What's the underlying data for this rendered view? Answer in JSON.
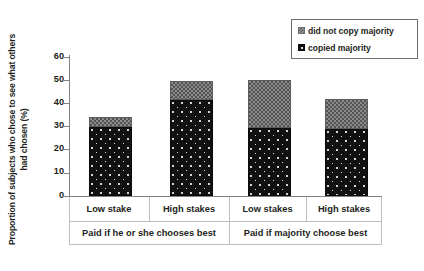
{
  "chart_data": {
    "type": "bar",
    "subtype": "stacked",
    "title": "",
    "xlabel": "",
    "ylabel": "Proportion of subjects who  chose to see what others\nhad chosen (%)",
    "ylim": [
      0,
      60
    ],
    "yticks": [
      0,
      10,
      20,
      30,
      40,
      50,
      60
    ],
    "ytick_labels": [
      "0",
      "10",
      "20",
      "30",
      "40",
      "50",
      "60"
    ],
    "grid": false,
    "legend_position": "top-right",
    "categories": [
      "Low stake",
      "High stakes",
      "Low stakes",
      "High stakes"
    ],
    "groups": [
      {
        "label": "Paid if he or she chooses best",
        "categories": [
          "Low stake",
          "High stakes"
        ]
      },
      {
        "label": "Paid if majority choose best",
        "categories": [
          "Low stakes",
          "High stakes"
        ]
      }
    ],
    "series": [
      {
        "name": "copied majority",
        "values": [
          30,
          41.5,
          29.5,
          29
        ]
      },
      {
        "name": "did not copy majority",
        "values": [
          4,
          8.2,
          20.8,
          13
        ]
      }
    ],
    "totals": [
      34,
      49.7,
      50.3,
      42
    ],
    "colors": {
      "copied_majority": "#111111",
      "did_not_copy_majority": "#8a8a8a",
      "axis": "#808285",
      "text": "#231f20"
    }
  },
  "legend": {
    "items": [
      {
        "label": "did not copy majority",
        "swatch": "gray-checker-swatch"
      },
      {
        "label": "copied majority",
        "swatch": "black-dotted-swatch"
      }
    ]
  },
  "axis": {
    "y_title": "Proportion of subjects who  chose to see what others\nhad chosen (%)",
    "y_ticks": [
      "60",
      "50",
      "40",
      "30",
      "20",
      "10",
      "0"
    ]
  },
  "categories_row": [
    "Low stake",
    "High stakes",
    "Low stakes",
    "High stakes"
  ],
  "groups_row": [
    "Paid if he or she chooses best",
    "Paid if majority choose best"
  ]
}
